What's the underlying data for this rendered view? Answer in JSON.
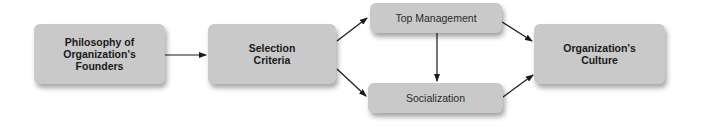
{
  "diagram": {
    "nodes": {
      "philosophy": {
        "label": "Philosophy of Organization's Founders",
        "lines": [
          "Philosophy of",
          "Organization's",
          "Founders"
        ]
      },
      "selection": {
        "label": "Selection Criteria",
        "lines": [
          "Selection",
          "Criteria"
        ]
      },
      "top_management": {
        "label": "Top Management"
      },
      "socialization": {
        "label": "Socialization"
      },
      "culture": {
        "label": "Organization's Culture",
        "lines": [
          "Organization's",
          "Culture"
        ]
      }
    },
    "edges": [
      {
        "from": "Philosophy of Organization's Founders",
        "to": "Selection Criteria"
      },
      {
        "from": "Selection Criteria",
        "to": "Top Management"
      },
      {
        "from": "Selection Criteria",
        "to": "Socialization"
      },
      {
        "from": "Top Management",
        "to": "Socialization"
      },
      {
        "from": "Top Management",
        "to": "Organization's Culture"
      },
      {
        "from": "Socialization",
        "to": "Organization's Culture"
      }
    ],
    "colors": {
      "node_fill": "#c9c9c9",
      "text": "#1a1a1a",
      "arrow": "#1a1a1a"
    }
  }
}
